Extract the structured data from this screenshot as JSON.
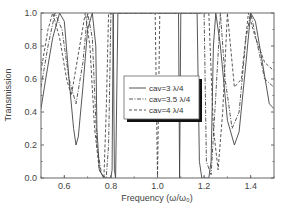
{
  "chart_data": {
    "type": "line",
    "title": "",
    "xlabel": "Frequency (ω/ω₀)",
    "ylabel": "Transmission",
    "xlim": [
      0.5,
      1.5
    ],
    "ylim": [
      0.0,
      1.0
    ],
    "x_ticks": [
      "0.6",
      "0.8",
      "1.0",
      "1.2",
      "1.4"
    ],
    "x_tick_values": [
      0.6,
      0.8,
      1.0,
      1.2,
      1.4
    ],
    "y_ticks": [
      "0.0",
      "0.2",
      "0.4",
      "0.6",
      "0.8",
      "1.0"
    ],
    "y_tick_values": [
      0.0,
      0.2,
      0.4,
      0.6,
      0.8,
      1.0
    ],
    "grid": false,
    "legend_position": "center",
    "series": [
      {
        "name": "cav=3 λ/4",
        "style": "solid",
        "points": [
          [
            0.5,
            0.42
          ],
          [
            0.52,
            0.6
          ],
          [
            0.55,
            0.85
          ],
          [
            0.58,
            1.0
          ],
          [
            0.6,
            0.95
          ],
          [
            0.62,
            0.6
          ],
          [
            0.64,
            0.3
          ],
          [
            0.65,
            0.2
          ],
          [
            0.66,
            0.25
          ],
          [
            0.68,
            0.55
          ],
          [
            0.7,
            0.9
          ],
          [
            0.72,
            1.0
          ],
          [
            0.735,
            0.8
          ],
          [
            0.74,
            0.3
          ],
          [
            0.75,
            0.05
          ],
          [
            0.77,
            0.0
          ],
          [
            0.8,
            0.0
          ],
          [
            0.805,
            0.05
          ],
          [
            0.81,
            1.0
          ],
          [
            0.815,
            0.05
          ],
          [
            0.82,
            0.0
          ],
          [
            0.83,
            1.0
          ],
          [
            0.95,
            1.0
          ],
          [
            1.09,
            1.0
          ],
          [
            1.095,
            0.0
          ],
          [
            1.1,
            1.0
          ],
          [
            1.17,
            1.0
          ],
          [
            1.18,
            0.1
          ],
          [
            1.19,
            0.0
          ],
          [
            1.22,
            0.0
          ],
          [
            1.23,
            0.1
          ],
          [
            1.24,
            0.8
          ],
          [
            1.25,
            1.0
          ],
          [
            1.27,
            0.8
          ],
          [
            1.3,
            0.35
          ],
          [
            1.33,
            0.2
          ],
          [
            1.35,
            0.28
          ],
          [
            1.38,
            0.7
          ],
          [
            1.4,
            1.0
          ],
          [
            1.42,
            0.95
          ],
          [
            1.45,
            0.7
          ],
          [
            1.48,
            0.45
          ],
          [
            1.5,
            0.42
          ]
        ]
      },
      {
        "name": "cav=3.5 λ/4",
        "style": "dash-dot",
        "points": [
          [
            0.5,
            0.55
          ],
          [
            0.53,
            0.8
          ],
          [
            0.56,
            1.0
          ],
          [
            0.59,
            0.9
          ],
          [
            0.62,
            0.6
          ],
          [
            0.65,
            0.45
          ],
          [
            0.68,
            0.7
          ],
          [
            0.7,
            1.0
          ],
          [
            0.72,
            0.85
          ],
          [
            0.74,
            0.2
          ],
          [
            0.76,
            0.02
          ],
          [
            0.78,
            0.0
          ],
          [
            0.79,
            0.2
          ],
          [
            0.8,
            1.0
          ],
          [
            1.0,
            1.0
          ],
          [
            1.2,
            1.0
          ],
          [
            1.21,
            0.1
          ],
          [
            1.23,
            0.02
          ],
          [
            1.25,
            0.5
          ],
          [
            1.27,
            1.0
          ],
          [
            1.29,
            0.6
          ],
          [
            1.32,
            0.3
          ],
          [
            1.35,
            0.4
          ],
          [
            1.38,
            0.85
          ],
          [
            1.4,
            1.0
          ],
          [
            1.43,
            0.8
          ],
          [
            1.46,
            0.6
          ],
          [
            1.5,
            0.55
          ]
        ]
      },
      {
        "name": "cav=4 λ/4",
        "style": "dashed",
        "points": [
          [
            0.5,
            0.65
          ],
          [
            0.53,
            0.9
          ],
          [
            0.55,
            1.0
          ],
          [
            0.58,
            0.85
          ],
          [
            0.61,
            0.6
          ],
          [
            0.63,
            0.5
          ],
          [
            0.66,
            0.75
          ],
          [
            0.69,
            1.0
          ],
          [
            0.71,
            0.8
          ],
          [
            0.73,
            0.3
          ],
          [
            0.75,
            0.05
          ],
          [
            0.77,
            0.0
          ],
          [
            0.78,
            0.4
          ],
          [
            0.79,
            1.0
          ],
          [
            0.99,
            1.0
          ],
          [
            1.0,
            0.0
          ],
          [
            1.01,
            1.0
          ],
          [
            1.22,
            1.0
          ],
          [
            1.24,
            0.3
          ],
          [
            1.26,
            0.05
          ],
          [
            1.28,
            0.4
          ],
          [
            1.3,
            1.0
          ],
          [
            1.33,
            0.55
          ],
          [
            1.36,
            0.6
          ],
          [
            1.39,
            1.0
          ],
          [
            1.42,
            0.85
          ],
          [
            1.46,
            0.7
          ],
          [
            1.5,
            0.65
          ]
        ]
      }
    ]
  },
  "legend": {
    "entries": [
      "cav=3 λ/4",
      "cav=3.5 λ/4",
      "cav=4 λ/4"
    ]
  },
  "axes": {
    "xlabel": "Frequency (ω/ω₀)",
    "ylabel": "Transmission"
  }
}
